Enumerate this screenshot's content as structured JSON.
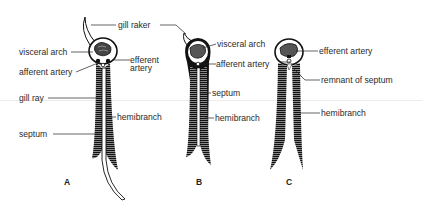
{
  "figure": {
    "panels": [
      {
        "id": "A",
        "letter": "A",
        "labels": {
          "gill_raker": "gill raker",
          "visceral_arch": "visceral arch",
          "afferent_artery": "afferent artery",
          "efferent_artery_l1": "efferent",
          "efferent_artery_l2": "artery",
          "gill_ray": "gill ray",
          "hemibranch": "hemibranch",
          "septum": "septum"
        }
      },
      {
        "id": "B",
        "letter": "B",
        "labels": {
          "visceral_arch": "visceral arch",
          "afferent_artery": "afferent artery",
          "septum": "septum",
          "hemibranch": "hemibranch"
        }
      },
      {
        "id": "C",
        "letter": "C",
        "labels": {
          "efferent_artery": "efferent artery",
          "remnant_of_septum": "remnant of septum",
          "hemibranch": "hemibranch"
        }
      }
    ],
    "colors": {
      "ink": "#1a1a1a",
      "background": "#ffffff"
    }
  }
}
